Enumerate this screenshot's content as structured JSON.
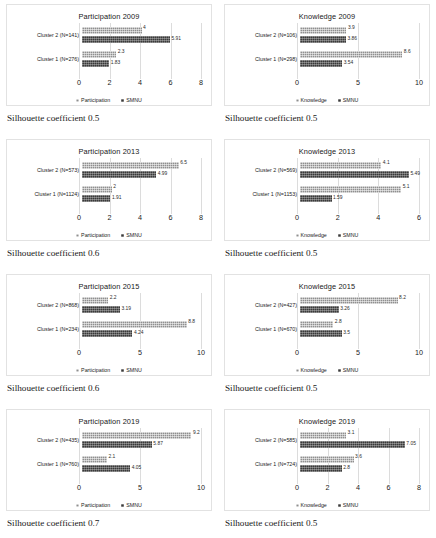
{
  "figure": {
    "series_names": [
      "Participation",
      "Knowledge",
      "SMNU"
    ],
    "colors": {
      "series1": "#8f8f8f",
      "series2": "#3a3a3a",
      "gridline": "#dcdcdc",
      "panel_border": "#e2e2e2"
    }
  },
  "panels": [
    {
      "caption": "Silhouette coefficient 0.5",
      "chart_data": {
        "type": "bar",
        "orientation": "horizontal",
        "title": "Participation 2009",
        "categories": [
          "Cluster 1 (N=276)",
          "Cluster 2 (N=141)"
        ],
        "series": [
          {
            "name": "Participation",
            "values": [
              2.3,
              4
            ]
          },
          {
            "name": "SMNU",
            "values": [
              1.83,
              5.91
            ]
          }
        ],
        "value_labels": [
          [
            "2.3",
            "4"
          ],
          [
            "1.83",
            "5.91"
          ]
        ],
        "xlabel": "",
        "ylabel": "",
        "xlim": [
          0,
          8
        ],
        "xticks": [
          "0",
          "2",
          "4",
          "6",
          "8"
        ],
        "grid": true,
        "legend": [
          "Participation",
          "SMNU"
        ],
        "legend_position": "bottom"
      }
    },
    {
      "caption": "Silhouette coefficient 0.5",
      "chart_data": {
        "type": "bar",
        "orientation": "horizontal",
        "title": "Knowledge 2009",
        "categories": [
          "Cluster 1 (N=298)",
          "Cluster 2 (N=106)"
        ],
        "series": [
          {
            "name": "Knowledge",
            "values": [
              8.6,
              3.9
            ]
          },
          {
            "name": "SMNU",
            "values": [
              3.54,
              3.86
            ]
          }
        ],
        "value_labels": [
          [
            "8.6",
            "3.9"
          ],
          [
            "3.54",
            "3.86"
          ]
        ],
        "xlabel": "",
        "ylabel": "",
        "xlim": [
          0,
          10
        ],
        "xticks": [
          "0",
          "5",
          "10"
        ],
        "grid": true,
        "legend": [
          "Knowledge",
          "SMNU"
        ],
        "legend_position": "bottom"
      }
    },
    {
      "caption": "Silhouette coefficient 0.6",
      "chart_data": {
        "type": "bar",
        "orientation": "horizontal",
        "title": "Participation 2013",
        "categories": [
          "Cluster 1 (N=1124)",
          "Cluster 2 (N=573)"
        ],
        "series": [
          {
            "name": "Participation",
            "values": [
              2,
              6.5
            ]
          },
          {
            "name": "SMNU",
            "values": [
              1.91,
              4.99
            ]
          }
        ],
        "value_labels": [
          [
            "2",
            "6.5"
          ],
          [
            "1.91",
            "4.99"
          ]
        ],
        "xlabel": "",
        "ylabel": "",
        "xlim": [
          0,
          8
        ],
        "xticks": [
          "0",
          "2",
          "4",
          "6",
          "8"
        ],
        "grid": true,
        "legend": [
          "Participation",
          "SMNU"
        ],
        "legend_position": "bottom"
      }
    },
    {
      "caption": "Silhouette coefficient 0.5",
      "chart_data": {
        "type": "bar",
        "orientation": "horizontal",
        "title": "Knowledge 2013",
        "categories": [
          "Cluster 1 (N=1153)",
          "Cluster 2 (N=569)"
        ],
        "series": [
          {
            "name": "Knowledge",
            "values": [
              5.1,
              4.1
            ]
          },
          {
            "name": "SMNU",
            "values": [
              1.59,
              5.49
            ]
          }
        ],
        "value_labels": [
          [
            "5.1",
            "4.1"
          ],
          [
            "1.59",
            "5.49"
          ]
        ],
        "xlabel": "",
        "ylabel": "",
        "xlim": [
          0,
          6
        ],
        "xticks": [
          "0",
          "2",
          "4",
          "6"
        ],
        "grid": true,
        "legend": [
          "Knowledge",
          "SMNU"
        ],
        "legend_position": "bottom"
      }
    },
    {
      "caption": "Silhouette coefficient 0.6",
      "chart_data": {
        "type": "bar",
        "orientation": "horizontal",
        "title": "Participation 2015",
        "categories": [
          "Cluster 1 (N=234)",
          "Cluster 2 (N=868)"
        ],
        "series": [
          {
            "name": "Participation",
            "values": [
              8.8,
              2.2
            ]
          },
          {
            "name": "SMNU",
            "values": [
              4.24,
              3.19
            ]
          }
        ],
        "value_labels": [
          [
            "8.8",
            "2.2"
          ],
          [
            "4.24",
            "3.19"
          ]
        ],
        "xlabel": "",
        "ylabel": "",
        "xlim": [
          0,
          10
        ],
        "xticks": [
          "0",
          "5",
          "10"
        ],
        "grid": true,
        "legend": [
          "Participation",
          "SMNU"
        ],
        "legend_position": "bottom"
      }
    },
    {
      "caption": "Silhouette coefficient 0.5",
      "chart_data": {
        "type": "bar",
        "orientation": "horizontal",
        "title": "Knowledge 2015",
        "categories": [
          "Cluster 1 (N=670)",
          "Cluster 2 (N=427)"
        ],
        "series": [
          {
            "name": "Knowledge",
            "values": [
              2.8,
              8.2
            ]
          },
          {
            "name": "SMNU",
            "values": [
              3.5,
              3.26
            ]
          }
        ],
        "value_labels": [
          [
            "2.8",
            "8.2"
          ],
          [
            "3.5",
            "3.26"
          ]
        ],
        "xlabel": "",
        "ylabel": "",
        "xlim": [
          0,
          10
        ],
        "xticks": [
          "0",
          "5",
          "10"
        ],
        "grid": true,
        "legend": [
          "Knowledge",
          "SMNU"
        ],
        "legend_position": "bottom"
      }
    },
    {
      "caption": "Silhouette coefficient 0.7",
      "chart_data": {
        "type": "bar",
        "orientation": "horizontal",
        "title": "Participation 2019",
        "categories": [
          "Cluster 1 (N=760)",
          "Cluster 2 (N=435)"
        ],
        "series": [
          {
            "name": "Participation",
            "values": [
              2.1,
              9.2
            ]
          },
          {
            "name": "SMNU",
            "values": [
              4.05,
              5.87
            ]
          }
        ],
        "value_labels": [
          [
            "2.1",
            "9.2"
          ],
          [
            "4.05",
            "5.87"
          ]
        ],
        "xlabel": "",
        "ylabel": "",
        "xlim": [
          0,
          10
        ],
        "xticks": [
          "0",
          "5",
          "10"
        ],
        "grid": true,
        "legend": [
          "Participation",
          "SMNU"
        ],
        "legend_position": "bottom"
      }
    },
    {
      "caption": "Silhouette coefficient 0.5",
      "chart_data": {
        "type": "bar",
        "orientation": "horizontal",
        "title": "Knowledge 2019",
        "categories": [
          "Cluster 1 (N=724)",
          "Cluster 2 (N=585)"
        ],
        "series": [
          {
            "name": "Knowledge",
            "values": [
              3.6,
              3.1
            ]
          },
          {
            "name": "SMNU",
            "values": [
              2.8,
              7.05
            ]
          }
        ],
        "value_labels": [
          [
            "3.6",
            "3.1"
          ],
          [
            "2.8",
            "7.05"
          ]
        ],
        "xlabel": "",
        "ylabel": "",
        "xlim": [
          0,
          8
        ],
        "xticks": [
          "0",
          "2",
          "4",
          "6",
          "8"
        ],
        "grid": true,
        "legend": [
          "Knowledge",
          "SMNU"
        ],
        "legend_position": "bottom"
      }
    }
  ]
}
